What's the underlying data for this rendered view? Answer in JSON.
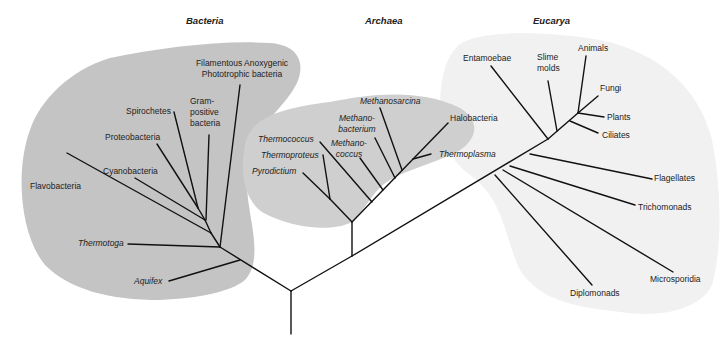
{
  "colors": {
    "bacteria_region": "#c4c4c4",
    "archaea_region": "#cfcfcf",
    "eucarya_region": "#f0f0f0",
    "branch": "#111111",
    "text": "#222222"
  },
  "domains": [
    {
      "name": "Bacteria",
      "x": 186,
      "y": 15
    },
    {
      "name": "Archaea",
      "x": 365,
      "y": 15
    },
    {
      "name": "Eucarya",
      "x": 533,
      "y": 15
    }
  ],
  "bacteria": {
    "taxa": [
      {
        "line1": "Filamentous Anoxygenic",
        "line2": "Phototrophic bacteria",
        "italic": false
      },
      {
        "line1": "Gram-",
        "line2": "positive",
        "line3": "bacteria",
        "italic": false
      },
      {
        "line1": "Spirochetes",
        "italic": false
      },
      {
        "line1": "Proteobacteria",
        "italic": false
      },
      {
        "line1": "Cyanobacteria",
        "italic": false
      },
      {
        "line1": "Flavobacteria",
        "italic": false
      },
      {
        "line1": "Thermotoga",
        "italic": true
      },
      {
        "line1": "Aquifex",
        "italic": true
      }
    ]
  },
  "archaea": {
    "taxa": [
      {
        "line1": "Methanosarcina",
        "italic": true
      },
      {
        "line1": "Methano-",
        "line2": "bacterium",
        "italic": true
      },
      {
        "line1": "Methano-",
        "line2": "coccus",
        "italic": true
      },
      {
        "line1": "Thermococcus",
        "italic": true
      },
      {
        "line1": "Thermoproteus",
        "italic": true
      },
      {
        "line1": "Pyrodictium",
        "italic": true
      },
      {
        "line1": "Halobacteria",
        "italic": false
      },
      {
        "line1": "Thermoplasma",
        "italic": true
      }
    ]
  },
  "eucarya": {
    "taxa": [
      {
        "line1": "Entamoebae",
        "italic": false
      },
      {
        "line1": "Slime",
        "line2": "molds",
        "italic": false
      },
      {
        "line1": "Animals",
        "italic": false
      },
      {
        "line1": "Fungi",
        "italic": false
      },
      {
        "line1": "Plants",
        "italic": false
      },
      {
        "line1": "Ciliates",
        "italic": false
      },
      {
        "line1": "Flagellates",
        "italic": false
      },
      {
        "line1": "Trichomonads",
        "italic": false
      },
      {
        "line1": "Microsporidia",
        "italic": false
      },
      {
        "line1": "Diplomonads",
        "italic": false
      }
    ]
  }
}
